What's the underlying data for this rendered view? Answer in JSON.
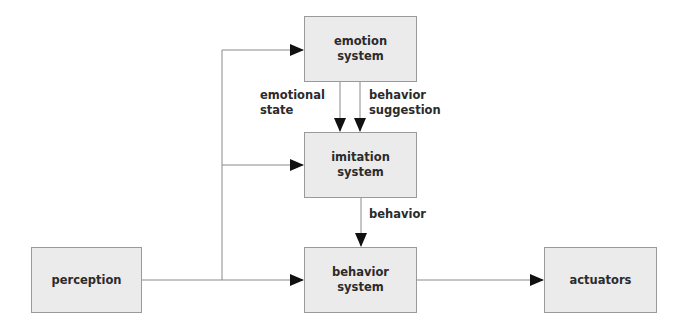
{
  "diagram": {
    "nodes": [
      {
        "id": "emotion",
        "label": "emotion\nsystem",
        "x": 304,
        "y": 16,
        "w": 113,
        "h": 66
      },
      {
        "id": "imitation",
        "label": "imitation\nsystem",
        "x": 304,
        "y": 132,
        "w": 113,
        "h": 66
      },
      {
        "id": "behavior",
        "label": "behavior\nsystem",
        "x": 304,
        "y": 247,
        "w": 113,
        "h": 66
      },
      {
        "id": "perception",
        "label": "perception",
        "x": 31,
        "y": 247,
        "w": 111,
        "h": 66
      },
      {
        "id": "actuators",
        "label": "actuators",
        "x": 544,
        "y": 247,
        "w": 113,
        "h": 66
      }
    ],
    "edge_labels": {
      "emotional_state": "emotional\nstate",
      "behavior_suggestion": "behavior\nsuggestion",
      "behavior": "behavior"
    },
    "edges": [
      {
        "from": "perception",
        "to": "emotion"
      },
      {
        "from": "perception",
        "to": "imitation"
      },
      {
        "from": "perception",
        "to": "behavior"
      },
      {
        "from": "emotion",
        "to": "imitation",
        "label": "emotional state"
      },
      {
        "from": "emotion",
        "to": "imitation",
        "label": "behavior suggestion"
      },
      {
        "from": "imitation",
        "to": "behavior",
        "label": "behavior"
      },
      {
        "from": "behavior",
        "to": "actuators"
      }
    ],
    "colors": {
      "box_fill": "#ebebeb",
      "box_border": "#9a9a9a",
      "line": "#8a8a8a",
      "arrowhead": "#111111",
      "text": "#2b2b2b"
    }
  }
}
